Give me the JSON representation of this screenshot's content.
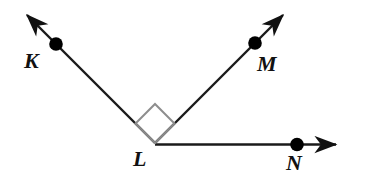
{
  "figure": {
    "background_color": "#ffffff",
    "stroke_color": "#1a1a1a",
    "point_color": "#000000",
    "right_angle_color": "#8a8a8a"
  },
  "labels": {
    "K": "K",
    "L": "L",
    "M": "M",
    "N": "N"
  },
  "points": [
    {
      "name": "K",
      "label": "K",
      "x": 56,
      "y": 44,
      "radius": 6.5,
      "filled": true
    },
    {
      "name": "M",
      "label": "M",
      "x": 255,
      "y": 43,
      "radius": 6.5,
      "filled": true
    },
    {
      "name": "N",
      "label": "N",
      "x": 297,
      "y": 145,
      "radius": 6.5,
      "filled": true
    },
    {
      "name": "L",
      "label": "L",
      "x": 155,
      "y": 143,
      "radius": 0,
      "filled": false
    }
  ],
  "vertex": {
    "name": "L",
    "label": "L",
    "x": 155,
    "y": 143
  },
  "rays": [
    {
      "name": "ray-LK",
      "from": "L",
      "through": "K",
      "arrow": true,
      "x1": 155,
      "y1": 143,
      "x2": 24,
      "y2": 12,
      "angle_deg": 135
    },
    {
      "name": "ray-LM",
      "from": "L",
      "through": "M",
      "arrow": true,
      "x1": 155,
      "y1": 143,
      "x2": 286,
      "y2": 12,
      "angle_deg": 45
    },
    {
      "name": "ray-LN",
      "from": "L",
      "through": "N",
      "arrow": true,
      "x1": 155,
      "y1": 144,
      "x2": 341,
      "y2": 144,
      "angle_deg": 0
    }
  ],
  "angle_markers": [
    {
      "name": "right-angle-KLM",
      "type": "right-angle-square",
      "between": [
        "ray-LK",
        "ray-LM"
      ],
      "vertex": "L",
      "measure": "90",
      "unit": "degrees",
      "size": 28
    }
  ]
}
